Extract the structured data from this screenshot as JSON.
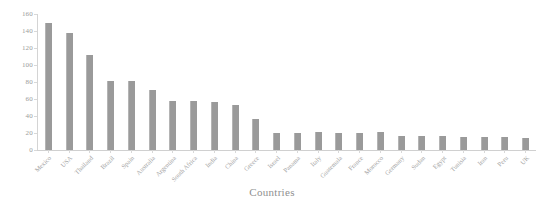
{
  "chart_data": {
    "type": "bar",
    "title": "",
    "subtitle": "",
    "xlabel": "Countries",
    "ylabel": "",
    "grid": false,
    "legend": null,
    "ylim": [
      0,
      160
    ],
    "ytick_step": 20,
    "ytick_labels": [
      "160",
      "140",
      "120",
      "100",
      "80",
      "60",
      "40",
      "20",
      "0"
    ],
    "bar_color": "#9a9a9a",
    "categories": [
      "Mexico",
      "USA",
      "Thailand",
      "Brazil",
      "Spain",
      "Australia",
      "Argentina",
      "South Africa",
      "India",
      "China",
      "Greece",
      "Israel",
      "Panama",
      "Italy",
      "Guatemala",
      "France",
      "Morocco",
      "Germany",
      "Sudan",
      "Egypt",
      "Tunisia",
      "Iran",
      "Peru",
      "UK"
    ],
    "values": [
      150,
      138,
      112,
      81,
      81,
      71,
      58,
      58,
      56,
      53,
      36,
      20,
      20,
      21,
      20,
      20,
      21,
      17,
      16,
      16,
      15,
      15,
      15,
      14
    ]
  }
}
